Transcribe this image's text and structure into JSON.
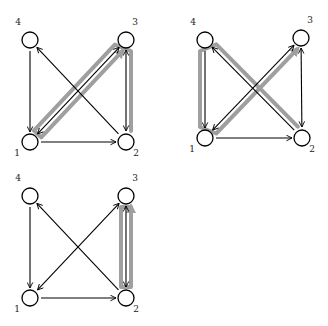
{
  "diagrams": [
    {
      "id": "graph-a",
      "nodes": [
        {
          "id": "1",
          "label": "1"
        },
        {
          "id": "2",
          "label": "2"
        },
        {
          "id": "3",
          "label": "3"
        },
        {
          "id": "4",
          "label": "4"
        }
      ],
      "edges": [
        {
          "from": "4",
          "to": "1",
          "double": false
        },
        {
          "from": "1",
          "to": "2",
          "double": false
        },
        {
          "from": "2",
          "to": "4",
          "double": false
        },
        {
          "from": "1",
          "to": "3",
          "double": true
        },
        {
          "from": "2",
          "to": "3",
          "double": true
        }
      ],
      "highlighted_path": [
        "2",
        "3",
        "1",
        "3"
      ]
    },
    {
      "id": "graph-b",
      "nodes": [
        {
          "id": "1",
          "label": "1"
        },
        {
          "id": "2",
          "label": "2"
        },
        {
          "id": "3",
          "label": "3"
        },
        {
          "id": "4",
          "label": "4"
        }
      ],
      "edges": [
        {
          "from": "4",
          "to": "1",
          "double": false
        },
        {
          "from": "1",
          "to": "2",
          "double": false
        },
        {
          "from": "2",
          "to": "4",
          "double": false
        },
        {
          "from": "1",
          "to": "3",
          "double": true
        },
        {
          "from": "2",
          "to": "3",
          "double": true
        }
      ],
      "highlighted_path": [
        "2",
        "4",
        "1",
        "3"
      ]
    },
    {
      "id": "graph-c",
      "nodes": [
        {
          "id": "1",
          "label": "1"
        },
        {
          "id": "2",
          "label": "2"
        },
        {
          "id": "3",
          "label": "3"
        },
        {
          "id": "4",
          "label": "4"
        }
      ],
      "edges": [
        {
          "from": "4",
          "to": "1",
          "double": false
        },
        {
          "from": "1",
          "to": "2",
          "double": false
        },
        {
          "from": "2",
          "to": "4",
          "double": false
        },
        {
          "from": "1",
          "to": "3",
          "double": true
        },
        {
          "from": "2",
          "to": "3",
          "double": true
        }
      ],
      "highlighted_path": [
        "2",
        "3",
        "2",
        "3"
      ]
    }
  ],
  "colors": {
    "node_stroke": "#000000",
    "edge": "#000000",
    "highlight": "#9a9a9a"
  }
}
